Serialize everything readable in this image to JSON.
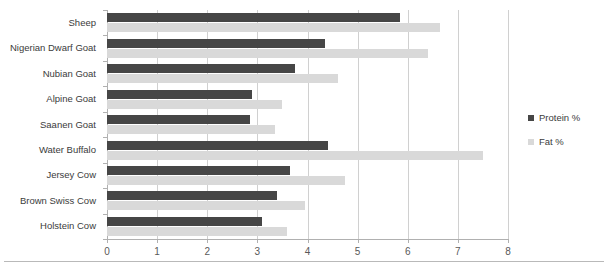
{
  "chart_data": {
    "type": "bar",
    "orientation": "horizontal",
    "title": "",
    "xlabel": "",
    "ylabel": "",
    "xlim": [
      0,
      8
    ],
    "xticks": [
      "0",
      "1",
      "2",
      "3",
      "4",
      "5",
      "6",
      "7",
      "8"
    ],
    "grid": true,
    "legend_position": "right",
    "categories": [
      "Sheep",
      "Nigerian Dwarf Goat",
      "Nubian Goat",
      "Alpine Goat",
      "Saanen Goat",
      "Water Buffalo",
      "Jersey Cow",
      "Brown Swiss Cow",
      "Holstein Cow"
    ],
    "series": [
      {
        "name": "Protein %",
        "color": "#464646",
        "values": [
          5.85,
          4.35,
          3.75,
          2.9,
          2.85,
          4.4,
          3.65,
          3.4,
          3.1
        ]
      },
      {
        "name": "Fat %",
        "color": "#d9d9d9",
        "values": [
          6.65,
          6.4,
          4.6,
          3.5,
          3.35,
          7.5,
          4.75,
          3.95,
          3.6
        ]
      }
    ]
  },
  "legend": {
    "items": [
      {
        "label": "Protein %",
        "color": "#464646"
      },
      {
        "label": "Fat %",
        "color": "#d9d9d9"
      }
    ]
  }
}
